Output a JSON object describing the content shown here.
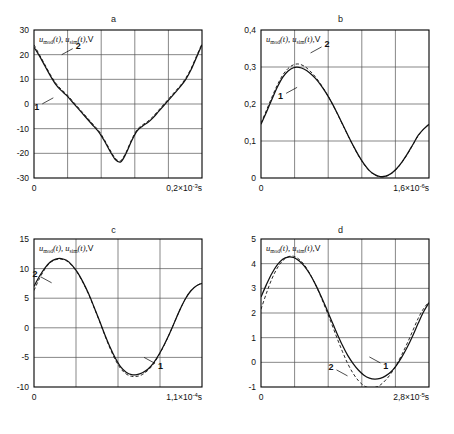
{
  "figure": {
    "panel_letters": [
      "a",
      "b",
      "c",
      "d"
    ],
    "series_labels": [
      "1",
      "2"
    ],
    "axis_label_prefix": "u",
    "axis_label_sub_1": "mod",
    "axis_label_sub_2": "sim",
    "axis_label_arg": "(t),",
    "axis_label_unit": "V",
    "colors": {
      "curve_solid": "#111111",
      "curve_dashed": "#111111",
      "grid": "#555555",
      "frame": "#000000",
      "background": "#ffffff"
    }
  },
  "chart_data": [
    {
      "type": "line",
      "panel": "a",
      "title": "a",
      "xlabel": "",
      "ylabel": "u_mod(t), u_sim(t), V",
      "ylim": [
        -30,
        30
      ],
      "xlim": [
        0,
        0.0002
      ],
      "yticks": [
        30,
        20,
        10,
        0,
        -10,
        -20,
        -30
      ],
      "ytick_labels": [
        "30",
        "20",
        "10",
        "0",
        "-10",
        "-20",
        "-30"
      ],
      "xtick_labels": [
        "0",
        "0,2×10⁻³s"
      ],
      "x_end_mantissa": "0,2",
      "x_end_exponent": "-3",
      "x_end_unit": "s",
      "grid_cols": 5,
      "grid_rows": 6,
      "grid": true,
      "legend": "inline-callouts",
      "series": [
        {
          "name": "1",
          "style": "solid",
          "values": [
            23.0,
            19.5,
            15.5,
            11.5,
            8.0,
            5.5,
            3.5,
            1.0,
            -1.5,
            -4.0,
            -6.5,
            -9.0,
            -11.5,
            -15.0,
            -19.0,
            -22.5,
            -23.5,
            -20.0,
            -15.0,
            -11.0,
            -9.0,
            -7.5,
            -5.5,
            -3.0,
            -0.5,
            2.0,
            4.5,
            7.0,
            10.0,
            14.0,
            19.0,
            24.0
          ]
        },
        {
          "name": "2",
          "style": "dashed",
          "values": [
            24.0,
            20.0,
            16.0,
            12.0,
            8.5,
            6.0,
            4.0,
            1.5,
            -1.0,
            -3.5,
            -6.0,
            -8.5,
            -11.0,
            -14.5,
            -18.5,
            -22.0,
            -23.0,
            -19.5,
            -14.5,
            -10.5,
            -8.5,
            -7.0,
            -5.0,
            -2.5,
            0.0,
            2.5,
            5.0,
            7.5,
            10.5,
            14.5,
            19.5,
            24.5
          ]
        }
      ],
      "callouts": [
        {
          "label": "1",
          "x_frac": 0.115,
          "y_value": 2.5
        },
        {
          "label": "2",
          "x_frac": 0.165,
          "y_value": 20.0
        }
      ]
    },
    {
      "type": "line",
      "panel": "b",
      "title": "b",
      "xlabel": "",
      "ylabel": "u_mod(t), u_sim(t), V",
      "ylim": [
        0,
        0.4
      ],
      "xlim": [
        0,
        1.6e-06
      ],
      "yticks": [
        0.4,
        0.3,
        0.2,
        0.1,
        0
      ],
      "ytick_labels": [
        "0,4",
        "0,3",
        "0,2",
        "0,1",
        "0"
      ],
      "xtick_labels": [
        "0",
        "1,6×10⁻⁶s"
      ],
      "x_end_mantissa": "1,6",
      "x_end_exponent": "-6",
      "x_end_unit": "s",
      "grid_cols": 5,
      "grid_rows": 4,
      "grid": true,
      "legend": "inline-callouts",
      "series": [
        {
          "name": "1",
          "style": "solid",
          "values": [
            0.145,
            0.178,
            0.212,
            0.245,
            0.272,
            0.289,
            0.298,
            0.299,
            0.294,
            0.284,
            0.27,
            0.252,
            0.23,
            0.205,
            0.177,
            0.147,
            0.117,
            0.088,
            0.061,
            0.038,
            0.02,
            0.009,
            0.004,
            0.005,
            0.012,
            0.025,
            0.043,
            0.065,
            0.09,
            0.115,
            0.132,
            0.145
          ]
        },
        {
          "name": "2",
          "style": "dashed",
          "values": [
            0.148,
            0.183,
            0.218,
            0.251,
            0.278,
            0.296,
            0.306,
            0.308,
            0.302,
            0.29,
            0.274,
            0.254,
            0.231,
            0.205,
            0.176,
            0.146,
            0.116,
            0.087,
            0.06,
            0.037,
            0.019,
            0.008,
            0.003,
            0.004,
            0.011,
            0.024,
            0.042,
            0.064,
            0.089,
            0.114,
            0.132,
            0.146
          ]
        }
      ],
      "callouts": [
        {
          "label": "1",
          "x_frac": 0.215,
          "y_value": 0.245
        },
        {
          "label": "2",
          "x_frac": 0.295,
          "y_value": 0.338
        }
      ]
    },
    {
      "type": "line",
      "panel": "c",
      "title": "c",
      "xlabel": "",
      "ylabel": "u_mod(t), u_sim(t), V",
      "ylim": [
        -10,
        15
      ],
      "xlim": [
        0,
        0.00011
      ],
      "yticks": [
        15,
        10,
        5,
        0,
        -5,
        -10
      ],
      "ytick_labels": [
        "15",
        "10",
        "5",
        "0",
        "-5",
        "-10"
      ],
      "xtick_labels": [
        "0",
        "1,1×10⁻⁴s"
      ],
      "x_end_mantissa": "1,1",
      "x_end_exponent": "-4",
      "x_end_unit": "s",
      "grid_cols": 4,
      "grid_rows": 5,
      "grid": true,
      "legend": "inline-callouts",
      "series": [
        {
          "name": "1",
          "style": "solid",
          "values": [
            7.0,
            8.7,
            10.1,
            11.1,
            11.6,
            11.7,
            11.4,
            10.6,
            9.4,
            7.8,
            5.9,
            3.7,
            1.4,
            -1.0,
            -3.2,
            -5.1,
            -6.6,
            -7.5,
            -7.9,
            -7.9,
            -7.6,
            -7.0,
            -6.0,
            -4.6,
            -2.9,
            -1.0,
            1.1,
            3.2,
            5.0,
            6.3,
            7.1,
            7.5
          ]
        },
        {
          "name": "2",
          "style": "dashed",
          "values": [
            6.3,
            8.3,
            9.9,
            11.0,
            11.5,
            11.6,
            11.3,
            10.5,
            9.3,
            7.7,
            5.8,
            3.6,
            1.3,
            -1.1,
            -3.4,
            -5.4,
            -6.9,
            -7.8,
            -8.2,
            -8.2,
            -7.9,
            -7.2,
            -6.2,
            -4.7,
            -3.0,
            -1.0,
            1.1,
            3.2,
            5.0,
            6.3,
            7.1,
            7.6
          ]
        }
      ],
      "callouts": [
        {
          "label": "1",
          "x_frac": 0.655,
          "y_value": -5.0
        },
        {
          "label": "2",
          "x_frac": 0.105,
          "y_value": 7.6
        }
      ]
    },
    {
      "type": "line",
      "panel": "d",
      "title": "d",
      "xlabel": "",
      "ylabel": "u_mod(t), u_sim(t), V",
      "ylim": [
        -1,
        5
      ],
      "xlim": [
        0,
        2.8e-05
      ],
      "yticks": [
        5,
        4,
        3,
        2,
        1,
        0,
        -1
      ],
      "ytick_labels": [
        "5",
        "4",
        "3",
        "2",
        "1",
        "0",
        "-1"
      ],
      "xtick_labels": [
        "0",
        "2,8×10⁻⁵s"
      ],
      "x_end_mantissa": "2,8",
      "x_end_exponent": "-5",
      "x_end_unit": "s",
      "grid_cols": 5,
      "grid_rows": 6,
      "grid": true,
      "legend": "inline-callouts",
      "series": [
        {
          "name": "1",
          "style": "solid",
          "values": [
            2.65,
            3.15,
            3.6,
            3.95,
            4.18,
            4.27,
            4.25,
            4.12,
            3.9,
            3.58,
            3.18,
            2.72,
            2.22,
            1.7,
            1.18,
            0.7,
            0.28,
            -0.05,
            -0.32,
            -0.52,
            -0.64,
            -0.68,
            -0.65,
            -0.55,
            -0.38,
            -0.12,
            0.22,
            0.62,
            1.08,
            1.58,
            2.05,
            2.42
          ]
        },
        {
          "name": "2",
          "style": "dashed",
          "values": [
            2.15,
            2.8,
            3.38,
            3.82,
            4.12,
            4.28,
            4.3,
            4.18,
            3.95,
            3.6,
            3.18,
            2.68,
            2.14,
            1.58,
            1.0,
            0.45,
            -0.05,
            -0.45,
            -0.75,
            -0.95,
            -1.03,
            -1.02,
            -0.92,
            -0.72,
            -0.45,
            -0.1,
            0.32,
            0.78,
            1.28,
            1.78,
            2.18,
            2.45
          ]
        }
      ],
      "callouts": [
        {
          "label": "1",
          "x_frac": 0.645,
          "y_value": 0.22
        },
        {
          "label": "2",
          "x_frac": 0.515,
          "y_value": -0.55
        }
      ]
    }
  ]
}
